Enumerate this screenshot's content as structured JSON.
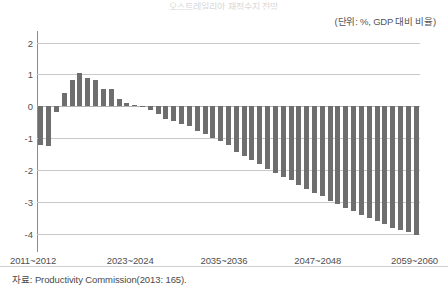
{
  "figure": {
    "unit_caption": "(단위: %, GDP 대비 비율)",
    "source_note": "자료: Productivity Commission(2013: 165).",
    "title_partial": "오스트레일리아 재정수지 전망"
  },
  "chart_data": {
    "type": "bar",
    "title": "오스트레일리아 재정수지 전망",
    "subtitle": "(단위: %, GDP 대비 비율)",
    "xlabel": "",
    "ylabel": "",
    "ylim": [
      -4.5,
      2.3
    ],
    "yticks": [
      2,
      1,
      0,
      -1,
      -2,
      -3,
      -4
    ],
    "ytick_labels": [
      "2",
      "1",
      "0",
      "-1",
      "-2",
      "-3",
      "-4"
    ],
    "xtick_labels": [
      "2011~2012",
      "2023~2024",
      "2035~2036",
      "2047~2048",
      "2059~2060"
    ],
    "xtick_indices": [
      0,
      12,
      24,
      36,
      48
    ],
    "grid": true,
    "legend": null,
    "bar_color": "#6e6e6e",
    "axis_color": "#8c8c8c",
    "gridline_color": "#c9c9c9",
    "categories": [
      "2011~2012",
      "2012~2013",
      "2013~2014",
      "2014~2015",
      "2015~2016",
      "2016~2017",
      "2017~2018",
      "2018~2019",
      "2019~2020",
      "2020~2021",
      "2021~2022",
      "2022~2023",
      "2023~2024",
      "2024~2025",
      "2025~2026",
      "2026~2027",
      "2027~2028",
      "2028~2029",
      "2029~2030",
      "2030~2031",
      "2031~2032",
      "2032~2033",
      "2033~2034",
      "2034~2035",
      "2035~2036",
      "2036~2037",
      "2037~2038",
      "2038~2039",
      "2039~2040",
      "2040~2041",
      "2041~2042",
      "2042~2043",
      "2043~2044",
      "2044~2045",
      "2045~2046",
      "2046~2047",
      "2047~2048",
      "2048~2049",
      "2049~2050",
      "2050~2051",
      "2051~2052",
      "2052~2053",
      "2053~2054",
      "2054~2055",
      "2055~2056",
      "2056~2057",
      "2057~2058",
      "2058~2059",
      "2059~2060"
    ],
    "values": [
      -1.2,
      -1.25,
      -0.18,
      0.42,
      0.82,
      1.05,
      0.88,
      0.82,
      0.55,
      0.55,
      0.22,
      0.12,
      0.05,
      -0.02,
      -0.12,
      -0.25,
      -0.38,
      -0.45,
      -0.55,
      -0.62,
      -0.78,
      -0.88,
      -0.98,
      -1.1,
      -1.22,
      -1.42,
      -1.55,
      -1.68,
      -1.82,
      -1.95,
      -2.08,
      -2.2,
      -2.32,
      -2.45,
      -2.58,
      -2.7,
      -2.82,
      -2.95,
      -3.05,
      -3.18,
      -3.28,
      -3.4,
      -3.5,
      -3.6,
      -3.7,
      -3.8,
      -3.88,
      -3.95,
      -4.02
    ]
  }
}
